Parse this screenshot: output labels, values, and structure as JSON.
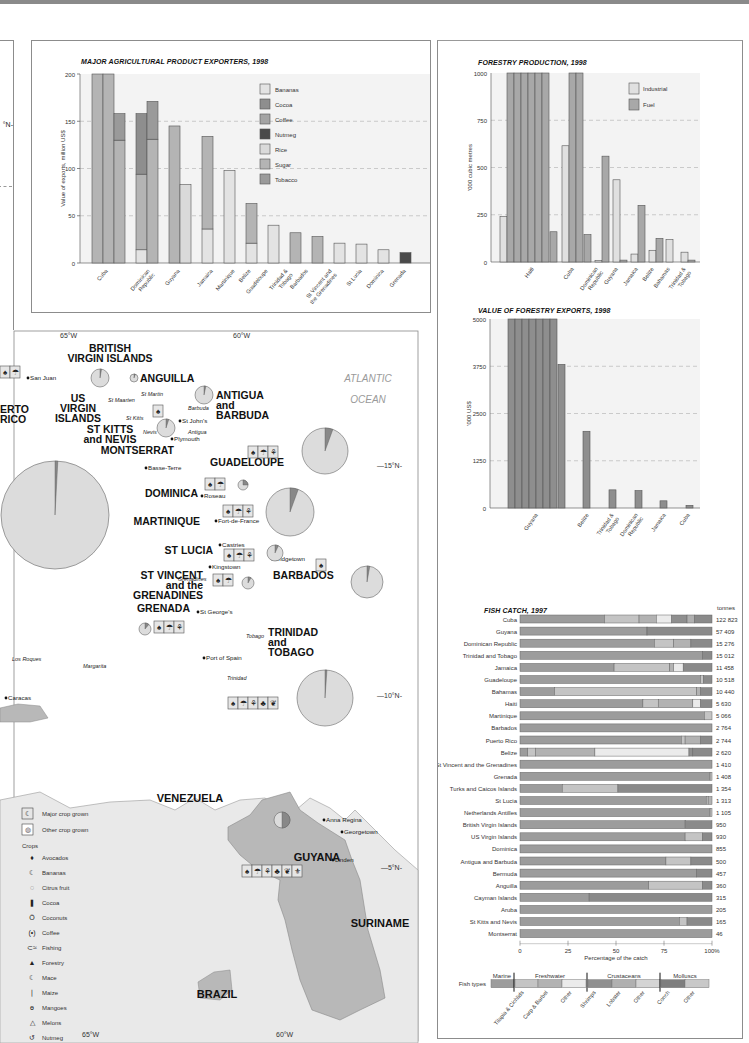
{
  "colors": {
    "bananas": "#e3e3e3",
    "cocoa": "#8e8e8e",
    "coffee": "#a4a4a4",
    "nutmeg": "#4a4a4a",
    "rice": "#dadada",
    "sugar": "#b4b4b4",
    "tobacco": "#9a9a9a",
    "industrial": "#e0e0e0",
    "fuel": "#a8a8a8",
    "plot_bg": "#f3f3f3",
    "grid": "#b8b8b8",
    "land": "#e9e9e9",
    "guyana": "#b8b8b8",
    "sea": "#ffffff"
  },
  "chart_data": [
    {
      "id": "agri",
      "type": "bar",
      "stacked": true,
      "title": "MAJOR AGRICULTURAL PRODUCT EXPORTERS, 1998",
      "xlabel": "",
      "ylabel": "Value of exports, million US$",
      "ylim": [
        0,
        200
      ],
      "yticks": [
        0,
        50,
        100,
        150,
        200
      ],
      "grid": "dashed horizontal",
      "legend_position": "upper right",
      "legend": [
        "Bananas",
        "Cocoa",
        "Coffee",
        "Nutmeg",
        "Rice",
        "Sugar",
        "Tobacco"
      ],
      "categories": [
        "Cuba",
        "Dominican Republic",
        "Guyana",
        "Jamaica",
        "Martinique",
        "Belize",
        "Guadeloupe",
        "Trinidad & Tobago",
        "Barbados",
        "St Vincent and the Grenadines",
        "St Lucia",
        "Dominica",
        "Grenada"
      ],
      "bars": [
        {
          "category": "Cuba",
          "segments": [
            {
              "series": "Sugar",
              "value": 200,
              "clipped": true
            }
          ]
        },
        {
          "category": "Cuba",
          "segments": [
            {
              "series": "Sugar",
              "value": 200,
              "clipped": true
            }
          ]
        },
        {
          "category": "Cuba",
          "segments": [
            {
              "series": "Sugar",
              "value": 130
            },
            {
              "series": "Tobacco",
              "value": 28
            }
          ]
        },
        {
          "category": "Dominican Republic",
          "segments": [
            {
              "series": "Bananas",
              "value": 14
            },
            {
              "series": "Sugar",
              "value": 80
            },
            {
              "series": "Cocoa",
              "value": 64
            }
          ]
        },
        {
          "category": "Dominican Republic",
          "segments": [
            {
              "series": "Sugar",
              "value": 131
            },
            {
              "series": "Tobacco",
              "value": 40
            }
          ]
        },
        {
          "category": "Guyana",
          "segments": [
            {
              "series": "Sugar",
              "value": 145
            }
          ]
        },
        {
          "category": "Guyana",
          "segments": [
            {
              "series": "Rice",
              "value": 83
            }
          ]
        },
        {
          "category": "Jamaica",
          "segments": [
            {
              "series": "Bananas",
              "value": 36
            },
            {
              "series": "Sugar",
              "value": 98
            }
          ]
        },
        {
          "category": "Martinique",
          "segments": [
            {
              "series": "Bananas",
              "value": 98
            }
          ]
        },
        {
          "category": "Belize",
          "segments": [
            {
              "series": "Bananas",
              "value": 21
            },
            {
              "series": "Sugar",
              "value": 42
            }
          ]
        },
        {
          "category": "Guadeloupe",
          "segments": [
            {
              "series": "Bananas",
              "value": 40
            }
          ]
        },
        {
          "category": "Trinidad & Tobago",
          "segments": [
            {
              "series": "Sugar",
              "value": 32
            }
          ]
        },
        {
          "category": "Barbados",
          "segments": [
            {
              "series": "Sugar",
              "value": 28
            }
          ]
        },
        {
          "category": "St Vincent and the Grenadines",
          "segments": [
            {
              "series": "Bananas",
              "value": 21
            }
          ]
        },
        {
          "category": "St Lucia",
          "segments": [
            {
              "series": "Bananas",
              "value": 20
            }
          ]
        },
        {
          "category": "Dominica",
          "segments": [
            {
              "series": "Bananas",
              "value": 14
            }
          ]
        },
        {
          "category": "Grenada",
          "segments": [
            {
              "series": "Nutmeg",
              "value": 11
            }
          ]
        }
      ]
    },
    {
      "id": "forestry_production",
      "type": "bar",
      "title": "FORESTRY PRODUCTION, 1998",
      "ylabel": "'000 cubic metres",
      "ylim": [
        0,
        1000
      ],
      "yticks": [
        0,
        250,
        500,
        750,
        1000
      ],
      "grid": "dashed horizontal",
      "legend_position": "upper right",
      "legend": [
        "Industrial",
        "Fuel"
      ],
      "categories": [
        "Haiti",
        "Cuba",
        "Dominican Republic",
        "Guyana",
        "Jamaica",
        "Belize",
        "Bahamas",
        "Trinidad & Tobago"
      ],
      "series": [
        {
          "name": "Industrial",
          "values": [
            240,
            615,
            8,
            435,
            42,
            62,
            118,
            52
          ]
        },
        {
          "name": "Fuel",
          "values": [
            5800,
            2500,
            560,
            10,
            300,
            125,
            0,
            10
          ]
        }
      ],
      "notes": "Haiti fuel and Cuba fuel bars exceed axis maximum and are drawn as broken columns; Haiti also shows a trailing fuel segment of ~160 and Cuba ~145"
    },
    {
      "id": "forestry_exports",
      "type": "bar",
      "title": "VALUE OF FORESTRY EXPORTS, 1998",
      "ylabel": "'000 US$",
      "ylim": [
        0,
        5000
      ],
      "yticks": [
        0,
        1250,
        2500,
        3750,
        5000
      ],
      "grid": "dashed horizontal",
      "categories": [
        "Guyana",
        "Belize",
        "Trinidad & Tobago",
        "Dominican Republic",
        "Jamaica",
        "Cuba"
      ],
      "values": [
        33800,
        2030,
        480,
        460,
        190,
        70
      ],
      "notes": "Guyana bar exceeds axis maximum; drawn as 7 full columns plus a remainder of ~3800"
    },
    {
      "id": "fish_catch",
      "type": "bar",
      "orientation": "horizontal",
      "stacked_percent": true,
      "title": "FISH CATCH, 1997",
      "xlabel": "Percentage of the catch",
      "xticks": [
        "0",
        "25",
        "50",
        "75",
        "100%"
      ],
      "value_header": "tonnes",
      "fish_types": {
        "groups": [
          "Marine",
          "Freshwater",
          "Crustaceans",
          "Molluscs"
        ],
        "subtypes": [
          "Marine",
          "Tilapia & Cichlids",
          "Carp & Barbel",
          "Other",
          "Shrimps",
          "Lobster",
          "Other",
          "Conch",
          "Other"
        ]
      },
      "rows": [
        {
          "country": "Cuba",
          "tonnes": "122 823",
          "segments": [
            44,
            18,
            9,
            8,
            8,
            4,
            9
          ]
        },
        {
          "country": "Guyana",
          "tonnes": "57 409",
          "segments": [
            66,
            0.5,
            33.5
          ]
        },
        {
          "country": "Dominican Republic",
          "tonnes": "15 276",
          "segments": [
            70,
            10,
            9,
            11
          ]
        },
        {
          "country": "Trinidad and Tobago",
          "tonnes": "15 012",
          "segments": [
            95,
            5
          ]
        },
        {
          "country": "Jamaica",
          "tonnes": "11 458",
          "segments": [
            49,
            29,
            2,
            5,
            15
          ]
        },
        {
          "country": "Guadeloupe",
          "tonnes": "10 518",
          "segments": [
            94,
            1.5,
            4.5
          ]
        },
        {
          "country": "Bahamas",
          "tonnes": "10 440",
          "segments": [
            18,
            74,
            2,
            6
          ]
        },
        {
          "country": "Haiti",
          "tonnes": "5 630",
          "segments": [
            64,
            8,
            18,
            4,
            6
          ]
        },
        {
          "country": "Martinique",
          "tonnes": "5 066",
          "segments": [
            96,
            4
          ]
        },
        {
          "country": "Barbados",
          "tonnes": "2 764",
          "segments": [
            100
          ]
        },
        {
          "country": "Puerto Rico",
          "tonnes": "2 744",
          "segments": [
            84,
            2,
            8,
            6
          ]
        },
        {
          "country": "Belize",
          "tonnes": "2 620",
          "segments": [
            4,
            4,
            31,
            49,
            2,
            10
          ]
        },
        {
          "country": "St Vincent and the Grenadines",
          "tonnes": "1 410",
          "segments": [
            100
          ]
        },
        {
          "country": "Grenada",
          "tonnes": "1 408",
          "segments": [
            99,
            1
          ]
        },
        {
          "country": "Turks and Caicos Islands",
          "tonnes": "1 354",
          "segments": [
            22,
            29,
            49
          ]
        },
        {
          "country": "St Lucia",
          "tonnes": "1 313",
          "segments": [
            97,
            1,
            2
          ]
        },
        {
          "country": "Netherlands Antilles",
          "tonnes": "1 105",
          "segments": [
            99,
            1
          ]
        },
        {
          "country": "British Virgin Islands",
          "tonnes": "950",
          "segments": [
            86,
            14
          ]
        },
        {
          "country": "US Virgin Islands",
          "tonnes": "930",
          "segments": [
            86,
            9,
            5
          ]
        },
        {
          "country": "Dominica",
          "tonnes": "855",
          "segments": [
            100
          ]
        },
        {
          "country": "Antigua and Barbuda",
          "tonnes": "500",
          "segments": [
            76,
            13,
            11
          ]
        },
        {
          "country": "Bermuda",
          "tonnes": "457",
          "segments": [
            92,
            8
          ]
        },
        {
          "country": "Anguilla",
          "tonnes": "360",
          "segments": [
            67,
            28,
            5
          ]
        },
        {
          "country": "Cayman Islands",
          "tonnes": "315",
          "segments": [
            36,
            64
          ]
        },
        {
          "country": "Aruba",
          "tonnes": "205",
          "segments": [
            100
          ]
        },
        {
          "country": "St Kitts and Nevis",
          "tonnes": "165",
          "segments": [
            83,
            4,
            13
          ]
        },
        {
          "country": "Montserrat",
          "tonnes": "46",
          "segments": [
            100
          ]
        }
      ]
    }
  ],
  "agri": {
    "title": "MAJOR AGRICULTURAL PRODUCT EXPORTERS, 1998",
    "ylabel": "Value of exports, million US$",
    "yticks": [
      "0",
      "50",
      "100",
      "150",
      "200"
    ],
    "legend": [
      "Bananas",
      "Cocoa",
      "Coffee",
      "Nutmeg",
      "Rice",
      "Sugar",
      "Tobacco"
    ],
    "xlabels": [
      "Cuba",
      "Dominican\nRepublic",
      "Guyana",
      "Jamaica",
      "Martinique",
      "Belize",
      "Guadeloupe",
      "Trinidad &\nTobago",
      "Barbados",
      "St Vincent and\nthe Grenadines",
      "St Lucia",
      "Dominica",
      "Grenada"
    ]
  },
  "forestry": {
    "title": "FORESTRY PRODUCTION, 1998",
    "ylabel": "'000 cubic metres",
    "yticks": [
      "0",
      "250",
      "500",
      "750",
      "1000"
    ],
    "legend": [
      "Industrial",
      "Fuel"
    ],
    "xlabels": [
      "Haiti",
      "Cuba",
      "Dominican\nRepublic",
      "Guyana",
      "Jamaica",
      "Belize",
      "Bahamas",
      "Trinidad &\nTobago"
    ]
  },
  "fexports": {
    "title": "VALUE OF FORESTRY EXPORTS, 1998",
    "ylabel": "'000 US$",
    "yticks": [
      "0",
      "1250",
      "2500",
      "3750",
      "5000"
    ],
    "xlabels": [
      "Guyana",
      "Belize",
      "Trinidad &\nTobago",
      "Dominican\nRepublic",
      "Jamaica",
      "Cuba"
    ]
  },
  "fish": {
    "title": "FISH CATCH, 1997",
    "unit": "tonnes",
    "xlabel": "Percentage of the catch",
    "xticks": [
      "0",
      "25",
      "50",
      "75",
      "100%"
    ],
    "types_label": "Fish types",
    "groups": [
      "Marine",
      "Freshwater",
      "Crustaceans",
      "Molluscs"
    ],
    "subtypes": [
      "Tilapia & Cichlids",
      "Carp & Barbel",
      "Other",
      "Shrimps",
      "Lobster",
      "Other",
      "Conch",
      "Other"
    ]
  },
  "map": {
    "longitudes": [
      "65°W",
      "60°W",
      "65°W",
      "60°W"
    ],
    "latitudes": [
      "15°N",
      "10°N",
      "5°N"
    ],
    "ocean": [
      "ATLANTIC",
      "OCEAN"
    ],
    "countries": [
      {
        "name": "BRITISH\nVIRGIN ISLANDS"
      },
      {
        "name": "ANGUILLA"
      },
      {
        "name": "US\nVIRGIN\nISLANDS"
      },
      {
        "name": "ANTIGUA\nand\nBARBUDA"
      },
      {
        "name": "ST KITTS\nand NEVIS"
      },
      {
        "name": "MONTSERRAT"
      },
      {
        "name": "GUADELOUPE"
      },
      {
        "name": "DOMINICA"
      },
      {
        "name": "MARTINIQUE"
      },
      {
        "name": "ST LUCIA"
      },
      {
        "name": "ST VINCENT\nand the\nGRENADINES"
      },
      {
        "name": "BARBADOS"
      },
      {
        "name": "GRENADA"
      },
      {
        "name": "TRINIDAD\nand\nTOBAGO"
      },
      {
        "name": "VENEZUELA"
      },
      {
        "name": "GUYANA"
      },
      {
        "name": "SURINAME"
      },
      {
        "name": "BRAZIL"
      },
      {
        "name": "ERTO\nRICO"
      }
    ],
    "places": [
      "San Juan",
      "St Martin",
      "St Maarten",
      "Barbuda",
      "St Kitts",
      "St John's",
      "Nevis",
      "Antigua",
      "Plymouth",
      "Basse-Terre",
      "Roseau",
      "Fort-de-France",
      "Castries",
      "Kingstown",
      "Grenadines",
      "Bridgetown",
      "St George's",
      "Tobago",
      "Los Roques",
      "Margarita",
      "Port of Spain",
      "Trinidad",
      "Caracas",
      "Anna Regina",
      "Georgetown",
      "Linden"
    ],
    "legend": {
      "major": "Major crop grown",
      "other": "Other crop grown",
      "crops_heading": "Crops",
      "crops": [
        "Avocados",
        "Bananas",
        "Citrus fruit",
        "Cocoa",
        "Coconuts",
        "Coffee",
        "Fishing",
        "Forestry",
        "Mace",
        "Maize",
        "Mangoes",
        "Melons",
        "Nutmeg",
        "Pineapples",
        "Rice",
        "Sugar cane",
        "Tobacco"
      ],
      "glyphs": [
        "avocado-icon",
        "banana-icon",
        "citrus-icon",
        "cocoa-icon",
        "coconut-icon",
        "coffee-icon",
        "fish-icon",
        "tree-icon",
        "mace-icon",
        "maize-icon",
        "mango-icon",
        "melon-icon",
        "nutmeg-icon",
        "pineapple-icon",
        "rice-icon",
        "sugarcane-icon",
        "tobacco-icon"
      ]
    }
  }
}
